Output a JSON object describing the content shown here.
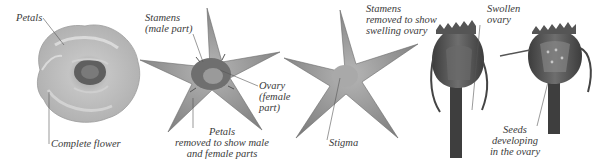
{
  "diagram": {
    "type": "botanical-development-sequence",
    "panels": [
      {
        "id": "complete-flower",
        "labels": [
          {
            "text": "Petals",
            "lines": [
              "Petals"
            ]
          },
          {
            "text": "Complete flower",
            "lines": [
              "Complete flower"
            ]
          }
        ]
      },
      {
        "id": "petals-removed",
        "labels": [
          {
            "text": "Stamens (male part)",
            "lines": [
              "Stamens",
              "(male part)"
            ]
          },
          {
            "text": "Ovary (female part)",
            "lines": [
              "Ovary",
              "(female",
              "part)"
            ]
          },
          {
            "text": "Petals removed to show male and female parts",
            "lines": [
              "Petals",
              "removed to show male",
              "and female parts"
            ]
          }
        ]
      },
      {
        "id": "stamens-removed",
        "labels": [
          {
            "text": "Stamens removed to show swelling ovary",
            "lines": [
              "Stamens",
              "removed to show",
              "swelling ovary"
            ]
          },
          {
            "text": "Stigma",
            "lines": [
              "Stigma"
            ]
          }
        ]
      },
      {
        "id": "swollen-ovary",
        "labels": [
          {
            "text": "Swollen ovary",
            "lines": [
              "Swollen",
              "ovary"
            ]
          }
        ]
      },
      {
        "id": "seeds-developing",
        "labels": [
          {
            "text": "Seeds developing in the ovary",
            "lines": [
              "Seeds",
              "developing",
              "in the ovary"
            ]
          }
        ]
      }
    ],
    "colors": {
      "background": "#ffffff",
      "label_text": "#3a3a3a",
      "leader_line": "#555555",
      "flower_light": "#d9d9d9",
      "flower_mid": "#a8a8a8",
      "flower_center": "#5a5a5a",
      "sepal": "#8c8c8c",
      "fruit_dark": "#4a4a4a"
    }
  }
}
